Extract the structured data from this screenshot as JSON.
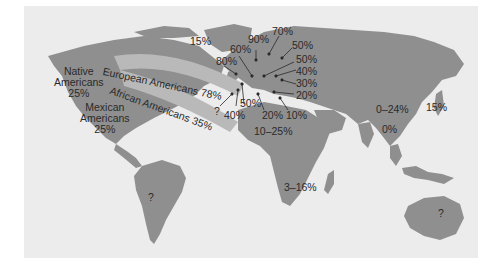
{
  "colors": {
    "ocean": "#ececec",
    "land": "#8f8f8f",
    "band": "#b9b9b9",
    "text": "#2a2a2a",
    "page": "#ffffff"
  },
  "labels": {
    "greenland": "15%",
    "native_americans": {
      "line1": "Native",
      "line2": "Americans",
      "value": "25%"
    },
    "mexican_americans": {
      "line1": "Mexican",
      "line2": "Americans",
      "value": "25%"
    },
    "european_americans": "European Americans 78%",
    "african_americans": "African Americans 35%",
    "europe": {
      "p90": "90%",
      "p70": "70%",
      "p60": "60%",
      "p80": "80%",
      "p50a": "50%",
      "p50b": "50%",
      "p40a": "40%",
      "p30": "30%",
      "p20a": "20%",
      "q": "?",
      "p50c": "50%",
      "p40b": "40%",
      "p20b": "20%",
      "p10": "10%"
    },
    "middle_east_n_africa": "10–25%",
    "southern_africa": "3–16%",
    "south_america": "?",
    "east_asia": "0–24%",
    "japan": "15%",
    "southeast_asia": "0%",
    "australia": "?"
  }
}
